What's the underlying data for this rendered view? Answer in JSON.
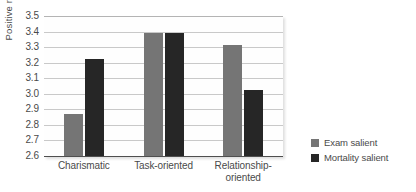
{
  "chart_data": {
    "type": "bar",
    "title": "",
    "xlabel": "",
    "ylabel": "Positive ratings",
    "ylim": [
      2.6,
      3.5
    ],
    "ytick_step": 0.1,
    "yticks": [
      "3.5",
      "3.4",
      "3.3",
      "3.2",
      "3.1",
      "3.0",
      "2.9",
      "2.8",
      "2.7",
      "2.6"
    ],
    "ytick_values": [
      3.5,
      3.4,
      3.3,
      3.2,
      3.1,
      3.0,
      2.9,
      2.8,
      2.7,
      2.6
    ],
    "grid": true,
    "legend_position": "right",
    "categories": [
      "Charismatic",
      "Task-oriented",
      "Relationship-oriented"
    ],
    "category_labels": [
      [
        "Charismatic"
      ],
      [
        "Task-oriented"
      ],
      [
        "Relationship-",
        "oriented"
      ]
    ],
    "series": [
      {
        "name": "Exam salient",
        "color": "#757575",
        "values": [
          2.87,
          3.39,
          3.31
        ]
      },
      {
        "name": "Mortality salient",
        "color": "#262626",
        "values": [
          3.22,
          3.39,
          3.02
        ]
      }
    ]
  },
  "colors": {
    "exam_salient": "#757575",
    "mortality_salient": "#262626",
    "gridline": "#c9c9c9",
    "axis": "#4f4f4f",
    "text": "#4a4a4a",
    "plot_background": "#fefefe"
  }
}
